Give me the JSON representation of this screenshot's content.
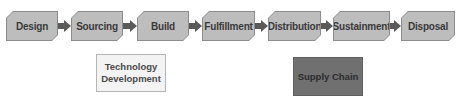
{
  "diagram": {
    "type": "process-flow",
    "stages": [
      {
        "label": "Design"
      },
      {
        "label": "Sourcing"
      },
      {
        "label": "Build"
      },
      {
        "label": "Fulfillment"
      },
      {
        "label": "Distribution"
      },
      {
        "label": "Sustainment"
      },
      {
        "label": "Disposal"
      }
    ],
    "legend": {
      "technology_development": "Technology Development",
      "supply_chain": "Supply Chain"
    },
    "colors": {
      "stage_fill": "#bdbdbd",
      "arrow": "#5a5a5a",
      "technology_development": "#f3f3f3",
      "supply_chain": "#707070"
    }
  }
}
